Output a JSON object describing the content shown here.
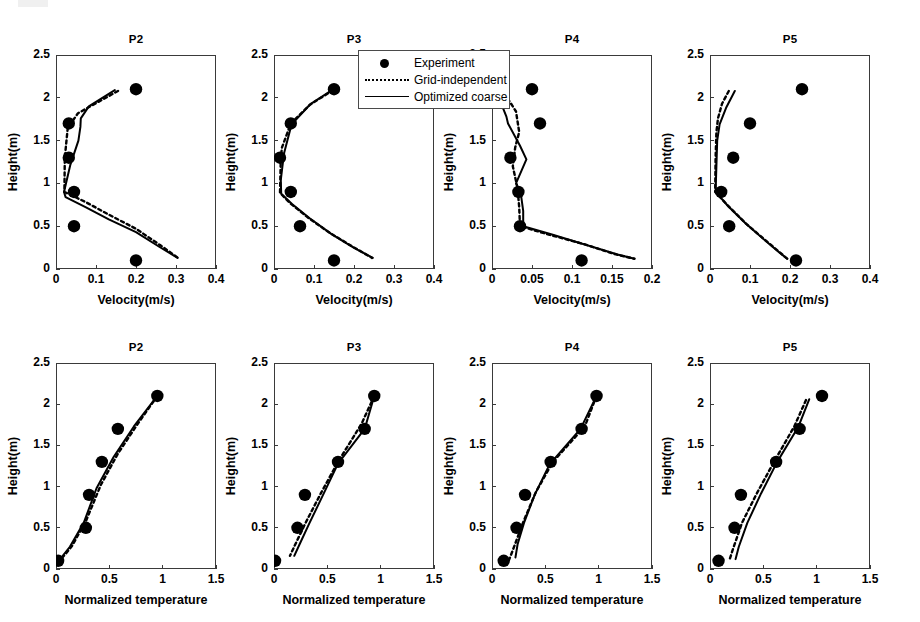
{
  "figure": {
    "legend": {
      "entries": [
        {
          "label": "Experiment",
          "style": "marker"
        },
        {
          "label": "Grid-independent",
          "style": "dotted"
        },
        {
          "label": "Optimized coarse",
          "style": "solid"
        }
      ]
    }
  },
  "chart_data": [
    {
      "id": "velocity-p2",
      "type": "scatter",
      "title": "P2",
      "xlabel": "Velocity(m/s)",
      "ylabel": "Height(m)",
      "xlim": [
        0,
        0.4
      ],
      "ylim": [
        0,
        2.5
      ],
      "xticks": [
        0,
        0.1,
        0.2,
        0.3,
        0.4
      ],
      "xticklabels": [
        "0",
        "0.1",
        "0.2",
        "0.3",
        "0.4"
      ],
      "yticks": [
        0,
        0.5,
        1,
        1.5,
        2,
        2.5
      ],
      "yticklabels": [
        "0",
        "0.5",
        "1",
        "1.5",
        "2",
        "2.5"
      ],
      "grid": false,
      "series": [
        {
          "name": "Experiment",
          "style": "marker",
          "x": [
            0.2,
            0.032,
            0.032,
            0.045,
            0.045,
            0.2
          ],
          "y": [
            2.1,
            1.7,
            1.3,
            0.9,
            0.5,
            0.1
          ]
        },
        {
          "name": "Grid-independent",
          "style": "dotted",
          "x": [
            0.155,
            0.055,
            0.04,
            0.03,
            0.022,
            0.021,
            0.075,
            0.13,
            0.2,
            0.26,
            0.305
          ],
          "y": [
            2.08,
            1.82,
            1.72,
            1.68,
            1.3,
            0.9,
            0.78,
            0.64,
            0.47,
            0.28,
            0.13
          ]
        },
        {
          "name": "Optimized coarse",
          "style": "solid",
          "x": [
            0.147,
            0.082,
            0.062,
            0.061,
            0.056,
            0.036,
            0.02,
            0.024,
            0.075,
            0.132,
            0.2,
            0.258,
            0.304
          ],
          "y": [
            2.09,
            1.9,
            1.76,
            1.66,
            1.5,
            1.22,
            0.9,
            0.84,
            0.72,
            0.58,
            0.43,
            0.26,
            0.13
          ]
        }
      ]
    },
    {
      "id": "velocity-p3",
      "type": "scatter",
      "title": "P3",
      "xlabel": "Velocity(m/s)",
      "ylabel": "Height(m)",
      "xlim": [
        0,
        0.4
      ],
      "ylim": [
        0,
        2.5
      ],
      "xticks": [
        0,
        0.1,
        0.2,
        0.3,
        0.4
      ],
      "xticklabels": [
        "0",
        "0.1",
        "0.2",
        "0.3",
        "0.4"
      ],
      "yticks": [
        0,
        0.5,
        1,
        1.5,
        2,
        2.5
      ],
      "yticklabels": [
        "0",
        "0.5",
        "1",
        "1.5",
        "2",
        "2.5"
      ],
      "grid": false,
      "series": [
        {
          "name": "Experiment",
          "style": "marker",
          "x": [
            0.15,
            0.042,
            0.015,
            0.042,
            0.065,
            0.15
          ],
          "y": [
            2.1,
            1.7,
            1.3,
            0.9,
            0.5,
            0.1
          ]
        },
        {
          "name": "Grid-independent",
          "style": "dotted",
          "x": [
            0.148,
            0.09,
            0.042,
            0.02,
            0.017,
            0.015,
            0.04,
            0.085,
            0.14,
            0.197,
            0.245
          ],
          "y": [
            2.09,
            1.92,
            1.7,
            1.42,
            1.3,
            0.89,
            0.77,
            0.6,
            0.42,
            0.26,
            0.13
          ]
        },
        {
          "name": "Optimized coarse",
          "style": "solid",
          "x": [
            0.148,
            0.092,
            0.044,
            0.025,
            0.017,
            0.018,
            0.045,
            0.09,
            0.143,
            0.199,
            0.247
          ],
          "y": [
            2.1,
            1.93,
            1.69,
            1.35,
            1.04,
            0.88,
            0.76,
            0.59,
            0.41,
            0.25,
            0.13
          ]
        }
      ]
    },
    {
      "id": "velocity-p4",
      "type": "scatter",
      "title": "P4",
      "xlabel": "Velocity(m/s)",
      "ylabel": "Height(m)",
      "xlim": [
        0,
        0.2
      ],
      "ylim": [
        0,
        2.5
      ],
      "xticks": [
        0,
        0.05,
        0.1,
        0.15,
        0.2
      ],
      "xticklabels": [
        "0",
        "0.05",
        "0.1",
        "0.15",
        "0.2"
      ],
      "yticks": [
        0,
        0.5,
        1,
        1.5,
        2,
        2.5
      ],
      "yticklabels": [
        "0",
        "0.5",
        "1",
        "1.5",
        "2",
        "2.5"
      ],
      "grid": false,
      "series": [
        {
          "name": "Experiment",
          "style": "marker",
          "x": [
            0.05,
            0.06,
            0.023,
            0.033,
            0.035,
            0.112
          ],
          "y": [
            2.1,
            1.7,
            1.3,
            0.9,
            0.5,
            0.1
          ]
        },
        {
          "name": "Grid-independent",
          "style": "dotted",
          "x": [
            0.011,
            0.03,
            0.034,
            0.029,
            0.026,
            0.032,
            0.034,
            0.035,
            0.072,
            0.115,
            0.155,
            0.178
          ],
          "y": [
            2.12,
            1.84,
            1.6,
            1.42,
            1.2,
            0.94,
            0.72,
            0.5,
            0.4,
            0.29,
            0.17,
            0.12
          ]
        },
        {
          "name": "Optimized coarse",
          "style": "solid",
          "x": [
            0.012,
            0.012,
            0.018,
            0.02,
            0.035,
            0.043,
            0.03,
            0.036,
            0.039,
            0.039,
            0.076,
            0.118,
            0.157,
            0.178
          ],
          "y": [
            2.12,
            1.92,
            1.78,
            1.7,
            1.44,
            1.28,
            1.0,
            0.88,
            0.68,
            0.5,
            0.4,
            0.28,
            0.17,
            0.12
          ]
        }
      ]
    },
    {
      "id": "velocity-p5",
      "type": "scatter",
      "title": "P5",
      "xlabel": "Velocity(m/s)",
      "ylabel": "Height(m)",
      "xlim": [
        0,
        0.4
      ],
      "ylim": [
        0,
        2.5
      ],
      "xticks": [
        0,
        0.1,
        0.2,
        0.3,
        0.4
      ],
      "xticklabels": [
        "0",
        "0.1",
        "0.2",
        "0.3",
        "0.4"
      ],
      "yticks": [
        0,
        0.5,
        1,
        1.5,
        2,
        2.5
      ],
      "yticklabels": [
        "0",
        "0.5",
        "1",
        "1.5",
        "2",
        "2.5"
      ],
      "grid": false,
      "series": [
        {
          "name": "Experiment",
          "style": "marker",
          "x": [
            0.23,
            0.1,
            0.058,
            0.028,
            0.048,
            0.215
          ],
          "y": [
            2.1,
            1.7,
            1.3,
            0.9,
            0.5,
            0.1
          ]
        },
        {
          "name": "Grid-independent",
          "style": "dotted",
          "x": [
            0.047,
            0.03,
            0.02,
            0.016,
            0.014,
            0.013,
            0.045,
            0.09,
            0.14,
            0.173,
            0.193
          ],
          "y": [
            2.08,
            1.93,
            1.76,
            1.6,
            1.3,
            0.9,
            0.74,
            0.53,
            0.33,
            0.2,
            0.12
          ]
        },
        {
          "name": "Optimized coarse",
          "style": "solid",
          "x": [
            0.062,
            0.04,
            0.024,
            0.018,
            0.016,
            0.014,
            0.046,
            0.092,
            0.141,
            0.174,
            0.193
          ],
          "y": [
            2.08,
            1.88,
            1.69,
            1.5,
            1.2,
            0.9,
            0.73,
            0.52,
            0.32,
            0.19,
            0.12
          ]
        }
      ]
    },
    {
      "id": "temperature-p2",
      "type": "scatter",
      "title": "P2",
      "xlabel": "Normalized temperature",
      "ylabel": "Height(m)",
      "xlim": [
        0,
        1.5
      ],
      "ylim": [
        0,
        2.5
      ],
      "xticks": [
        0,
        0.5,
        1,
        1.5
      ],
      "xticklabels": [
        "0",
        "0.5",
        "1",
        "1.5"
      ],
      "yticks": [
        0,
        0.5,
        1,
        1.5,
        2,
        2.5
      ],
      "yticklabels": [
        "0",
        "0.5",
        "1",
        "1.5",
        "2",
        "2.5"
      ],
      "grid": false,
      "series": [
        {
          "name": "Experiment",
          "style": "marker",
          "x": [
            0.95,
            0.58,
            0.43,
            0.31,
            0.28,
            0.02
          ],
          "y": [
            2.1,
            1.7,
            1.3,
            0.9,
            0.5,
            0.1
          ]
        },
        {
          "name": "Grid-independent",
          "style": "dotted",
          "x": [
            0.95,
            0.76,
            0.58,
            0.42,
            0.28,
            0.15,
            0.03
          ],
          "y": [
            2.1,
            1.75,
            1.4,
            1.02,
            0.58,
            0.28,
            0.09
          ]
        },
        {
          "name": "Optimized coarse",
          "style": "solid",
          "x": [
            0.95,
            0.73,
            0.54,
            0.38,
            0.26,
            0.13,
            0.02
          ],
          "y": [
            2.1,
            1.73,
            1.36,
            0.98,
            0.56,
            0.27,
            0.09
          ]
        }
      ]
    },
    {
      "id": "temperature-p3",
      "type": "scatter",
      "title": "P3",
      "xlabel": "Normalized temperature",
      "ylabel": "Height(m)",
      "xlim": [
        0,
        1.5
      ],
      "ylim": [
        0,
        2.5
      ],
      "xticks": [
        0,
        0.5,
        1,
        1.5
      ],
      "xticklabels": [
        "0",
        "0.5",
        "1",
        "1.5"
      ],
      "yticks": [
        0,
        0.5,
        1,
        1.5,
        2,
        2.5
      ],
      "yticklabels": [
        "0",
        "0.5",
        "1",
        "1.5",
        "2",
        "2.5"
      ],
      "grid": false,
      "series": [
        {
          "name": "Experiment",
          "style": "marker",
          "x": [
            0.94,
            0.85,
            0.6,
            0.29,
            0.22,
            0.01
          ],
          "y": [
            2.1,
            1.7,
            1.3,
            0.9,
            0.5,
            0.1
          ]
        },
        {
          "name": "Grid-independent",
          "style": "dotted",
          "x": [
            0.94,
            0.82,
            0.6,
            0.44,
            0.3,
            0.2,
            0.15
          ],
          "y": [
            2.1,
            1.76,
            1.3,
            0.92,
            0.57,
            0.3,
            0.16
          ]
        },
        {
          "name": "Optimized coarse",
          "style": "solid",
          "x": [
            0.94,
            0.85,
            0.6,
            0.46,
            0.33,
            0.24,
            0.19
          ],
          "y": [
            2.1,
            1.7,
            1.28,
            0.9,
            0.55,
            0.3,
            0.16
          ]
        }
      ]
    },
    {
      "id": "temperature-p4",
      "type": "scatter",
      "title": "P4",
      "xlabel": "Normalized temperature",
      "ylabel": "Height(m)",
      "xlim": [
        0,
        1.5
      ],
      "ylim": [
        0,
        2.5
      ],
      "xticks": [
        0,
        0.5,
        1,
        1.5
      ],
      "xticklabels": [
        "0",
        "0.5",
        "1",
        "1.5"
      ],
      "yticks": [
        0,
        0.5,
        1,
        1.5,
        2,
        2.5
      ],
      "yticklabels": [
        "0",
        "0.5",
        "1",
        "1.5",
        "2",
        "2.5"
      ],
      "grid": false,
      "series": [
        {
          "name": "Experiment",
          "style": "marker",
          "x": [
            0.98,
            0.84,
            0.55,
            0.31,
            0.23,
            0.11
          ],
          "y": [
            2.1,
            1.7,
            1.3,
            0.9,
            0.5,
            0.1
          ]
        },
        {
          "name": "Grid-independent",
          "style": "dotted",
          "x": [
            0.98,
            0.87,
            0.57,
            0.41,
            0.29,
            0.21,
            0.16
          ],
          "y": [
            2.1,
            1.73,
            1.3,
            0.93,
            0.56,
            0.28,
            0.11
          ]
        },
        {
          "name": "Optimized coarse",
          "style": "solid",
          "x": [
            0.98,
            0.83,
            0.54,
            0.4,
            0.3,
            0.24,
            0.22
          ],
          "y": [
            2.1,
            1.7,
            1.27,
            0.9,
            0.56,
            0.3,
            0.14
          ]
        }
      ]
    },
    {
      "id": "temperature-p5",
      "type": "scatter",
      "title": "P5",
      "xlabel": "Normalized temperature",
      "ylabel": "Height(m)",
      "xlim": [
        0,
        1.5
      ],
      "ylim": [
        0,
        2.5
      ],
      "xticks": [
        0,
        0.5,
        1,
        1.5
      ],
      "xticklabels": [
        "0",
        "0.5",
        "1",
        "1.5"
      ],
      "yticks": [
        0,
        0.5,
        1,
        1.5,
        2,
        2.5
      ],
      "yticklabels": [
        "0",
        "0.5",
        "1",
        "1.5",
        "2",
        "2.5"
      ],
      "grid": false,
      "series": [
        {
          "name": "Experiment",
          "style": "marker",
          "x": [
            1.05,
            0.84,
            0.62,
            0.29,
            0.23,
            0.08
          ],
          "y": [
            2.1,
            1.7,
            1.3,
            0.9,
            0.5,
            0.1
          ]
        },
        {
          "name": "Grid-independent",
          "style": "dotted",
          "x": [
            0.9,
            0.79,
            0.6,
            0.44,
            0.3,
            0.22,
            0.18
          ],
          "y": [
            2.05,
            1.73,
            1.3,
            0.92,
            0.56,
            0.26,
            0.1
          ]
        },
        {
          "name": "Optimized coarse",
          "style": "solid",
          "x": [
            0.93,
            0.83,
            0.63,
            0.48,
            0.35,
            0.27,
            0.24
          ],
          "y": [
            2.06,
            1.73,
            1.3,
            0.92,
            0.56,
            0.27,
            0.12
          ]
        }
      ]
    }
  ]
}
